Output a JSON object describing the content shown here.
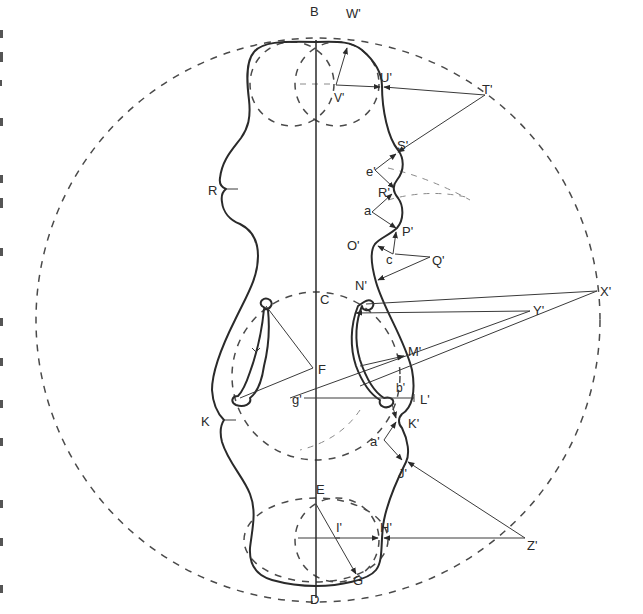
{
  "diagram": {
    "background": "#ffffff",
    "ink_color": "#2a2a2a",
    "labels": {
      "B": "B",
      "W": "W'",
      "U": "U'",
      "T": "T'",
      "V": "V'",
      "S": "S'",
      "e": "e'",
      "R_prime": "R'",
      "a": "a",
      "P": "P'",
      "O": "O'",
      "c": "c",
      "Q": "Q'",
      "N": "N'",
      "R": "R",
      "C": "C",
      "X": "X'",
      "Y": "Y'",
      "M": "M'",
      "F": "F",
      "g": "g'",
      "b": "b'",
      "L": "L'",
      "K": "K",
      "K_prime": "K'",
      "a_prime": "a'",
      "J": "J'",
      "E": "E",
      "I": "I'",
      "H": "H'",
      "Z": "Z'",
      "G": "G",
      "D": "D"
    }
  }
}
